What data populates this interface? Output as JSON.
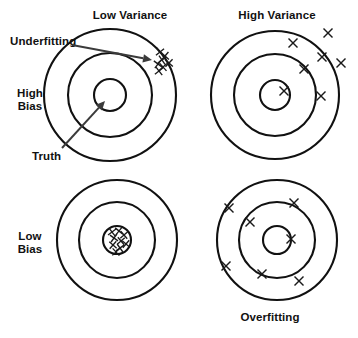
{
  "figure": {
    "title_text": "Bias-Variance Tradeoff Bullseye Diagram",
    "width": 358,
    "height": 338,
    "background_color": "#ffffff",
    "line_color": "#111111",
    "mark_color": "#1a1a1a",
    "arrow_color": "#3b3b3b"
  },
  "column_headers": [
    {
      "label": "Low Variance",
      "x": 130,
      "y": 19
    },
    {
      "label": "High Variance",
      "x": 277,
      "y": 19
    }
  ],
  "row_labels": [
    {
      "line1": "High",
      "line2": "Bias",
      "x": 30,
      "y1": 97,
      "y2": 110
    },
    {
      "line1": "Low",
      "line2": "Bias",
      "x": 30,
      "y1": 240,
      "y2": 253
    }
  ],
  "annotations": [
    {
      "name": "underfitting",
      "label": "Underfitting",
      "label_x": 10,
      "label_y": 45,
      "arrow_from_x": 72,
      "arrow_from_y": 45,
      "arrow_to_x": 152,
      "arrow_to_y": 60
    },
    {
      "name": "truth",
      "label": "Truth",
      "label_x": 32,
      "label_y": 160,
      "arrow_from_x": 62,
      "arrow_from_y": 148,
      "arrow_to_x": 105,
      "arrow_to_y": 101
    }
  ],
  "footer_labels": [
    {
      "label": "Overfitting",
      "x": 270,
      "y": 321
    }
  ],
  "chart_data": {
    "type": "scatter",
    "xlabel": "Variance",
    "ylabel": "Bias",
    "grid": false,
    "legend": "none",
    "panel_columns": [
      "Low Variance",
      "High Variance"
    ],
    "panel_rows": [
      "High Bias",
      "Low Bias"
    ],
    "targets": [
      {
        "name": "high-bias-low-variance",
        "row": "High Bias",
        "column": "Low Variance",
        "cx": 110,
        "cy": 95,
        "radii": [
          66,
          42,
          16
        ],
        "shots": [
          {
            "x": 160,
            "y": 52,
            "size": 7.4,
            "rot": 6
          },
          {
            "x": 165,
            "y": 56,
            "size": 7.4,
            "rot": -4
          },
          {
            "x": 162,
            "y": 60,
            "size": 7.4,
            "rot": 10
          },
          {
            "x": 158,
            "y": 64,
            "size": 7.4,
            "rot": -8
          },
          {
            "x": 163,
            "y": 67,
            "size": 7.4,
            "rot": 3
          },
          {
            "x": 169,
            "y": 63,
            "size": 7.4,
            "rot": -2
          },
          {
            "x": 159,
            "y": 71,
            "size": 7.4,
            "rot": 7
          }
        ]
      },
      {
        "name": "high-bias-high-variance",
        "row": "High Bias",
        "column": "High Variance",
        "cx": 275,
        "cy": 95,
        "radii": [
          64,
          41,
          15
        ],
        "shots": [
          {
            "x": 328,
            "y": 33,
            "size": 9.0,
            "rot": 0
          },
          {
            "x": 293,
            "y": 43,
            "size": 9.0,
            "rot": 0
          },
          {
            "x": 322,
            "y": 57,
            "size": 9.0,
            "rot": 0
          },
          {
            "x": 341,
            "y": 63,
            "size": 9.0,
            "rot": 0
          },
          {
            "x": 304,
            "y": 69,
            "size": 9.0,
            "rot": 0
          },
          {
            "x": 284,
            "y": 91,
            "size": 9.0,
            "rot": 0
          },
          {
            "x": 321,
            "y": 96,
            "size": 9.0,
            "rot": 0
          }
        ]
      },
      {
        "name": "low-bias-low-variance",
        "row": "Low Bias",
        "column": "Low Variance",
        "cx": 117,
        "cy": 240,
        "radii": [
          60,
          38,
          14
        ],
        "shots": [
          {
            "x": 112,
            "y": 232,
            "size": 7.0,
            "rot": 8
          },
          {
            "x": 119,
            "y": 231,
            "size": 7.0,
            "rot": -6
          },
          {
            "x": 124,
            "y": 235,
            "size": 7.0,
            "rot": 4
          },
          {
            "x": 114,
            "y": 238,
            "size": 7.0,
            "rot": -9
          },
          {
            "x": 121,
            "y": 241,
            "size": 7.0,
            "rot": 5
          },
          {
            "x": 113,
            "y": 245,
            "size": 7.0,
            "rot": -3
          },
          {
            "x": 120,
            "y": 248,
            "size": 7.0,
            "rot": 9
          },
          {
            "x": 126,
            "y": 244,
            "size": 7.0,
            "rot": -5
          },
          {
            "x": 116,
            "y": 252,
            "size": 7.0,
            "rot": 2
          }
        ]
      },
      {
        "name": "low-bias-high-variance",
        "row": "Low Bias",
        "column": "High Variance",
        "cx": 277,
        "cy": 240,
        "radii": [
          60,
          38,
          14
        ],
        "shots": [
          {
            "x": 229,
            "y": 208,
            "size": 9.0,
            "rot": 0
          },
          {
            "x": 294,
            "y": 203,
            "size": 9.0,
            "rot": 0
          },
          {
            "x": 250,
            "y": 222,
            "size": 9.0,
            "rot": 0
          },
          {
            "x": 291,
            "y": 239,
            "size": 9.0,
            "rot": 0
          },
          {
            "x": 226,
            "y": 266,
            "size": 9.0,
            "rot": 0
          },
          {
            "x": 262,
            "y": 274,
            "size": 9.0,
            "rot": 0
          },
          {
            "x": 299,
            "y": 281,
            "size": 9.0,
            "rot": 0
          }
        ]
      }
    ],
    "annotation_points": [
      {
        "label": "Underfitting",
        "points_to": "high-bias-low-variance shot cluster"
      },
      {
        "label": "Truth",
        "points_to": "bullseye center of high-bias-low-variance target"
      },
      {
        "label": "Overfitting",
        "points_to": "low-bias-high-variance target"
      }
    ]
  }
}
